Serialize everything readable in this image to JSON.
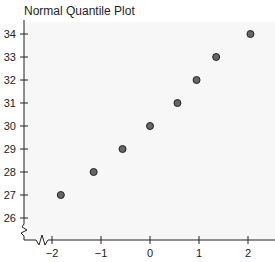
{
  "chart_data": {
    "type": "scatter",
    "title": "Normal Quantile Plot",
    "xlabel": "",
    "ylabel": "",
    "x_ticks": [
      -2,
      -1,
      0,
      1,
      2
    ],
    "y_ticks": [
      26,
      27,
      28,
      29,
      30,
      31,
      32,
      33,
      34
    ],
    "xlim": [
      -2.6,
      2.6
    ],
    "ylim": [
      25.2,
      34.4
    ],
    "axis_breaks": [
      "x",
      "y"
    ],
    "grid": false,
    "legend": null,
    "points": [
      {
        "x": -1.82,
        "y": 27
      },
      {
        "x": -1.15,
        "y": 28
      },
      {
        "x": -0.56,
        "y": 29
      },
      {
        "x": 0.0,
        "y": 30
      },
      {
        "x": 0.56,
        "y": 31
      },
      {
        "x": 0.95,
        "y": 32
      },
      {
        "x": 1.35,
        "y": 33
      },
      {
        "x": 2.05,
        "y": 34
      }
    ],
    "colors": {
      "point_fill": "#666666",
      "point_stroke": "#222222",
      "plot_bg": "#f7f7f7"
    }
  }
}
